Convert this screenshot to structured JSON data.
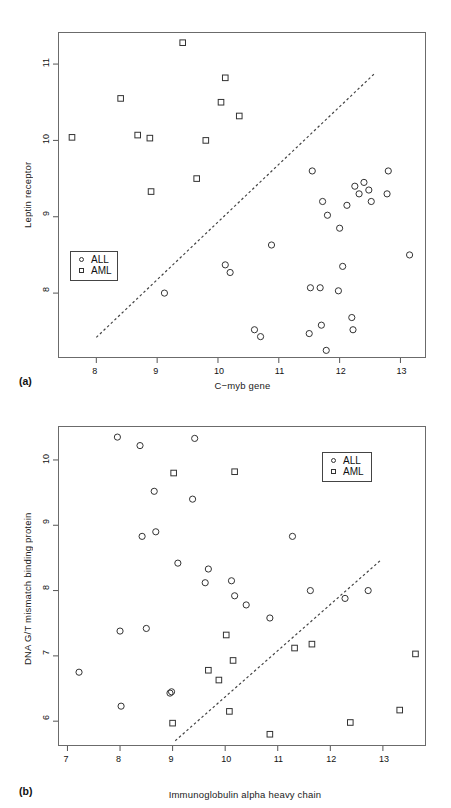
{
  "figure": {
    "panel_a_tag": "(a)",
    "panel_b_tag": "(b)"
  },
  "legend": {
    "all_label": "ALL",
    "aml_label": "AML",
    "all_symbol": "circle-marker",
    "aml_symbol": "square-marker"
  },
  "chart_data": [
    {
      "type": "scatter",
      "panel": "(a)",
      "title": "",
      "xlabel": "C−myb gene",
      "ylabel": "Leptin receptor",
      "xlim": [
        7.37,
        13.42
      ],
      "ylim": [
        7.15,
        11.42
      ],
      "xticks": [
        8,
        9,
        10,
        11,
        12,
        13
      ],
      "yticks": [
        8,
        9,
        10,
        11
      ],
      "grid": false,
      "legend_position": "bottom-left",
      "series": [
        {
          "name": "ALL",
          "marker": "circle",
          "x": [
            9.12,
            10.12,
            10.2,
            10.6,
            10.7,
            10.88,
            11.5,
            11.52,
            11.55,
            11.68,
            11.7,
            11.72,
            11.78,
            11.8,
            11.98,
            12.0,
            12.05,
            12.12,
            12.2,
            12.22,
            12.25,
            12.32,
            12.4,
            12.48,
            12.52,
            12.78,
            12.8,
            13.15
          ],
          "y": [
            8.0,
            8.37,
            8.27,
            7.52,
            7.43,
            8.63,
            7.47,
            8.07,
            9.6,
            8.07,
            7.58,
            9.2,
            7.25,
            9.02,
            8.03,
            8.85,
            8.35,
            9.15,
            7.68,
            7.52,
            9.4,
            9.3,
            9.45,
            9.35,
            9.2,
            9.3,
            9.6,
            8.5
          ]
        },
        {
          "name": "AML",
          "marker": "square",
          "x": [
            7.6,
            8.4,
            8.68,
            8.88,
            8.9,
            9.42,
            9.65,
            9.8,
            10.05,
            10.12,
            10.35
          ],
          "y": [
            10.04,
            10.55,
            10.07,
            10.03,
            9.33,
            11.28,
            9.5,
            10.0,
            10.5,
            10.82,
            10.32
          ]
        }
      ],
      "trend_line": {
        "style": "dashed",
        "x_start": 8.0,
        "y_start": 7.42,
        "x_end": 12.58,
        "y_end": 10.88
      }
    },
    {
      "type": "scatter",
      "panel": "(b)",
      "title": "",
      "xlabel": "Immunoglobulin alpha heavy chain",
      "ylabel": "DNA G/T mismatch binding protein",
      "xlim": [
        6.82,
        13.82
      ],
      "ylim": [
        5.62,
        10.52
      ],
      "xticks": [
        7,
        8,
        9,
        10,
        11,
        12,
        13
      ],
      "yticks": [
        6,
        7,
        8,
        9,
        10
      ],
      "grid": false,
      "legend_position": "top-right",
      "series": [
        {
          "name": "ALL",
          "marker": "circle",
          "x": [
            7.22,
            7.95,
            8.0,
            8.02,
            8.38,
            8.42,
            8.5,
            8.65,
            8.68,
            8.95,
            8.98,
            9.1,
            9.38,
            9.42,
            9.62,
            9.68,
            10.12,
            10.18,
            10.4,
            10.85,
            11.28,
            11.62,
            12.28,
            12.72
          ],
          "y": [
            6.75,
            10.35,
            7.38,
            6.23,
            10.22,
            8.83,
            7.42,
            9.52,
            8.9,
            6.43,
            6.45,
            8.42,
            9.4,
            10.33,
            8.12,
            8.33,
            8.15,
            7.92,
            7.78,
            7.58,
            8.83,
            8.0,
            7.88,
            8.0
          ]
        },
        {
          "name": "AML",
          "marker": "square",
          "x": [
            9.0,
            9.02,
            9.68,
            9.88,
            10.02,
            10.08,
            10.15,
            10.18,
            10.85,
            11.32,
            11.65,
            12.38,
            13.32,
            13.62
          ],
          "y": [
            5.97,
            9.8,
            6.78,
            6.63,
            7.32,
            6.15,
            6.93,
            9.82,
            5.8,
            7.12,
            7.18,
            5.98,
            6.17,
            7.03
          ]
        }
      ],
      "trend_line": {
        "style": "dashed",
        "x_start": 9.05,
        "y_start": 5.7,
        "x_end": 12.98,
        "y_end": 8.48
      }
    }
  ]
}
